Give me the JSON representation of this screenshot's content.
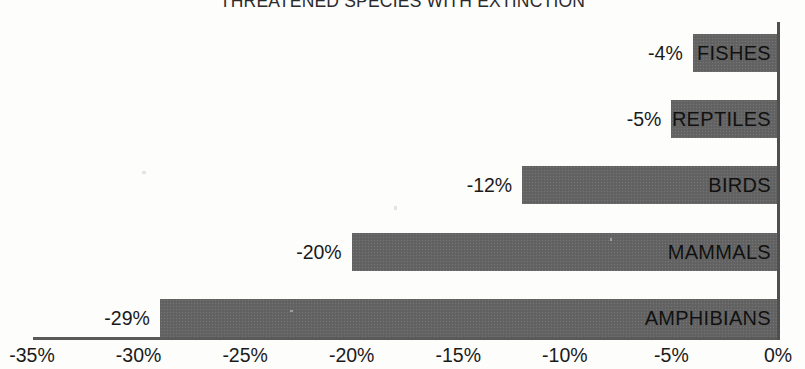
{
  "chart_data": {
    "type": "bar",
    "orientation": "horizontal",
    "title": "THREATENED SPECIES WITH EXTINCTION",
    "subtitle": "",
    "xlabel": "",
    "ylabel": "",
    "categories": [
      "FISHES",
      "REPTILES",
      "BIRDS",
      "MAMMALS",
      "AMPHIBIANS"
    ],
    "values": [
      -4,
      -5,
      -12,
      -20,
      -29
    ],
    "data_labels": [
      "-4%",
      "-5%",
      "-12%",
      "-20%",
      "-29%"
    ],
    "xlim": [
      -35,
      0
    ],
    "xticks": [
      -35,
      -30,
      -25,
      -20,
      -15,
      -10,
      -5,
      0
    ],
    "xtick_labels": [
      "-35%",
      "-30%",
      "-25%",
      "-20%",
      "-15%",
      "-10%",
      "-5%",
      "0%"
    ],
    "grid": false,
    "legend": false,
    "bar_color": "#646464",
    "axis_color": "#5a5a5a",
    "text_color": "#1a1a1a",
    "background": "#fdfdfc"
  },
  "bars": [
    {
      "category": "FISHES",
      "value": -4,
      "label": "-4%"
    },
    {
      "category": "REPTILES",
      "value": -5,
      "label": "-5%"
    },
    {
      "category": "BIRDS",
      "value": -12,
      "label": "-12%"
    },
    {
      "category": "MAMMALS",
      "value": -20,
      "label": "-20%"
    },
    {
      "category": "AMPHIBIANS",
      "value": -29,
      "label": "-29%"
    }
  ],
  "axis": {
    "ticks": [
      {
        "value": -35,
        "label": "-35%"
      },
      {
        "value": -30,
        "label": "-30%"
      },
      {
        "value": -25,
        "label": "-25%"
      },
      {
        "value": -20,
        "label": "-20%"
      },
      {
        "value": -15,
        "label": "-15%"
      },
      {
        "value": -10,
        "label": "-10%"
      },
      {
        "value": -5,
        "label": "-5%"
      },
      {
        "value": 0,
        "label": "0%"
      }
    ]
  }
}
